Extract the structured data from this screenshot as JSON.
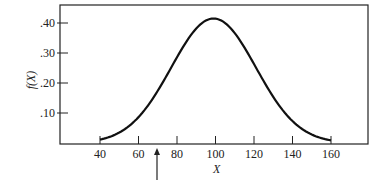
{
  "chart_data": {
    "type": "line",
    "title": "",
    "xlabel": "X",
    "ylabel": "f(X)",
    "xlim": [
      40,
      160
    ],
    "ylim": [
      0,
      0.45
    ],
    "x_ticks": [
      "40",
      "60",
      "80",
      "100",
      "120",
      "140",
      "160"
    ],
    "y_ticks": [
      ".10",
      ".20",
      ".30",
      ".40"
    ],
    "series": [
      {
        "name": "f(X)",
        "x": [
          40,
          50,
          60,
          70,
          80,
          90,
          100,
          110,
          120,
          130,
          140,
          150,
          160
        ],
        "values": [
          0.01,
          0.03,
          0.07,
          0.15,
          0.26,
          0.37,
          0.41,
          0.37,
          0.26,
          0.15,
          0.07,
          0.03,
          0.01
        ]
      }
    ],
    "annotations": [
      {
        "type": "arrow",
        "x": 70,
        "direction": "up"
      }
    ],
    "grid": false
  }
}
